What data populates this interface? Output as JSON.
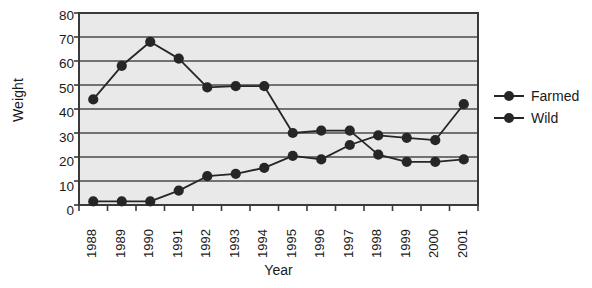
{
  "chart_data": {
    "type": "line",
    "title": "",
    "xlabel": "Year",
    "ylabel": "Weight",
    "categories": [
      "1988",
      "1989",
      "1990",
      "1991",
      "1992",
      "1993",
      "1994",
      "1995",
      "1996",
      "1997",
      "1998",
      "1999",
      "2000",
      "2001"
    ],
    "ylim": [
      0,
      80
    ],
    "yticks": [
      0,
      10,
      20,
      30,
      40,
      50,
      60,
      70,
      80
    ],
    "grid": true,
    "legend_position": "right",
    "series": [
      {
        "name": "Farmed",
        "color": "#262626",
        "values": [
          44,
          58,
          68,
          61,
          49,
          49.5,
          49.5,
          30,
          31,
          31,
          21,
          18,
          18,
          19
        ]
      },
      {
        "name": "Wild",
        "color": "#262626",
        "values": [
          1.5,
          1.5,
          1.5,
          6,
          12,
          13,
          15.5,
          20.5,
          19,
          25,
          29,
          28,
          27,
          42
        ]
      }
    ]
  },
  "axes": {
    "ylabel": "Weight",
    "xlabel": "Year",
    "ytick_labels": [
      "80",
      "70",
      "60",
      "50",
      "40",
      "30",
      "20",
      "10",
      "0"
    ],
    "xtick_labels": [
      "1988",
      "1989",
      "1990",
      "1991",
      "1992",
      "1993",
      "1994",
      "1995",
      "1996",
      "1997",
      "1998",
      "1999",
      "2000",
      "2001"
    ]
  },
  "legend": {
    "items": [
      {
        "label": "Farmed"
      },
      {
        "label": "Wild"
      }
    ]
  },
  "style": {
    "plot_background": "#e9e9e9",
    "axis_color": "#3a3a3a",
    "grid_color": "#4a4a4a",
    "series_color": "#262626"
  }
}
